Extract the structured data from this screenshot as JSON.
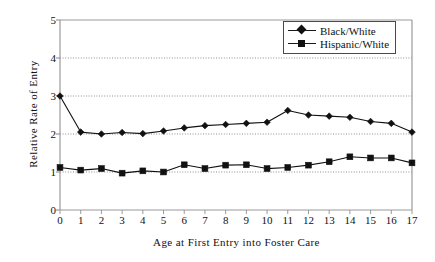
{
  "chart_data": {
    "type": "line",
    "title": "",
    "xlabel": "Age at First Entry into Foster Care",
    "ylabel": "Relative Rate of Entry",
    "categories": [
      0,
      1,
      2,
      3,
      4,
      5,
      6,
      7,
      8,
      9,
      10,
      11,
      12,
      13,
      14,
      15,
      16,
      17
    ],
    "x": [
      0,
      1,
      2,
      3,
      4,
      5,
      6,
      7,
      8,
      9,
      10,
      11,
      12,
      13,
      14,
      15,
      16,
      17
    ],
    "xlim": [
      0,
      17
    ],
    "ylim": [
      0,
      5
    ],
    "yticks": [
      0,
      1,
      2,
      3,
      4,
      5
    ],
    "xticks": [
      0,
      1,
      2,
      3,
      4,
      5,
      6,
      7,
      8,
      9,
      10,
      11,
      12,
      13,
      14,
      15,
      16,
      17
    ],
    "grid": "horizontal-dotted",
    "gridlines": [
      1,
      2,
      3,
      4
    ],
    "legend_position": "top-right",
    "series": [
      {
        "name": "Black/White",
        "marker": "diamond",
        "color": "#111111",
        "values": [
          3.0,
          2.05,
          2.0,
          2.04,
          2.01,
          2.08,
          2.16,
          2.22,
          2.25,
          2.28,
          2.31,
          2.62,
          2.5,
          2.47,
          2.44,
          2.33,
          2.28,
          2.05
        ]
      },
      {
        "name": "Hispanic/White",
        "marker": "square",
        "color": "#111111",
        "values": [
          1.12,
          1.05,
          1.09,
          0.97,
          1.03,
          1.0,
          1.19,
          1.09,
          1.18,
          1.19,
          1.09,
          1.12,
          1.18,
          1.27,
          1.4,
          1.37,
          1.37,
          1.24
        ]
      }
    ]
  },
  "axes": {
    "y_tick_labels": [
      "0",
      "1",
      "2",
      "3",
      "4",
      "5"
    ],
    "x_tick_labels": [
      "0",
      "1",
      "2",
      "3",
      "4",
      "5",
      "6",
      "7",
      "8",
      "9",
      "10",
      "11",
      "12",
      "13",
      "14",
      "15",
      "16",
      "17"
    ],
    "y_axis_title": "Relative Rate of Entry",
    "x_axis_title": "Age at First Entry into Foster Care"
  },
  "legend": {
    "items": [
      {
        "label": "Black/White",
        "marker": "diamond-marker-icon"
      },
      {
        "label": "Hispanic/White",
        "marker": "square-marker-icon"
      }
    ]
  },
  "style": {
    "plot_border_color": "#9a9a9a",
    "series_color": "#111111",
    "gridline_color": "#8f8f8f",
    "background": "#ffffff"
  }
}
